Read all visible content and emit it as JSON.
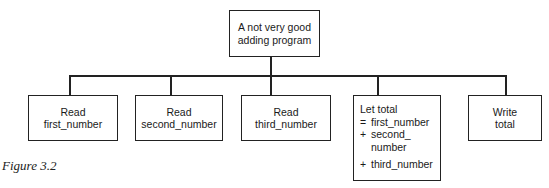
{
  "diagram": {
    "type": "structure-chart",
    "root": {
      "label_lines": [
        "A not very good",
        "adding program"
      ]
    },
    "children": [
      {
        "label_lines": [
          "Read",
          "first_number"
        ]
      },
      {
        "label_lines": [
          "Read",
          "second_number"
        ]
      },
      {
        "label_lines": [
          "Read",
          "third_number"
        ]
      },
      {
        "title": "Let total",
        "rows": [
          {
            "op": "=",
            "text": "first_number"
          },
          {
            "op": "+",
            "text": "second_"
          },
          {
            "op": "",
            "text": "number"
          },
          {
            "op": "+",
            "text": "third_number"
          }
        ]
      },
      {
        "label_lines": [
          "Write",
          "total"
        ]
      }
    ],
    "edges": [
      [
        "root",
        "children.0"
      ],
      [
        "root",
        "children.1"
      ],
      [
        "root",
        "children.2"
      ],
      [
        "root",
        "children.3"
      ],
      [
        "root",
        "children.4"
      ]
    ]
  },
  "caption": "Figure 3.2"
}
